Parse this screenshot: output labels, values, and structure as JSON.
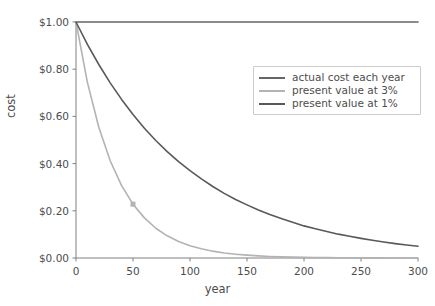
{
  "chart_data": {
    "type": "line",
    "title": "",
    "xlabel": "year",
    "ylabel": "cost",
    "xlim": [
      0,
      300
    ],
    "ylim": [
      0.0,
      1.0
    ],
    "grid": false,
    "legend_position": "upper right",
    "x_ticks": [
      0,
      50,
      100,
      150,
      200,
      250,
      300
    ],
    "x_tick_labels": [
      "0",
      "50",
      "100",
      "150",
      "200",
      "250",
      "300"
    ],
    "y_ticks": [
      0.0,
      0.2,
      0.4,
      0.6,
      0.8,
      1.0
    ],
    "y_tick_labels": [
      "$0.00",
      "$0.20",
      "$0.40",
      "$0.60",
      "$0.80",
      "$1.00"
    ],
    "x": [
      0,
      10,
      20,
      30,
      40,
      50,
      60,
      70,
      80,
      90,
      100,
      110,
      120,
      130,
      140,
      150,
      160,
      170,
      180,
      190,
      200,
      210,
      220,
      230,
      240,
      250,
      260,
      270,
      280,
      290,
      300
    ],
    "series": [
      {
        "name": "actual cost each year",
        "color": "#666666",
        "linewidth": 1.6,
        "values": [
          1.0,
          1.0,
          1.0,
          1.0,
          1.0,
          1.0,
          1.0,
          1.0,
          1.0,
          1.0,
          1.0,
          1.0,
          1.0,
          1.0,
          1.0,
          1.0,
          1.0,
          1.0,
          1.0,
          1.0,
          1.0,
          1.0,
          1.0,
          1.0,
          1.0,
          1.0,
          1.0,
          1.0,
          1.0,
          1.0,
          1.0
        ]
      },
      {
        "name": "present value at 3%",
        "color": "#b3b3b3",
        "linewidth": 1.6,
        "values": [
          1.0,
          0.744,
          0.554,
          0.412,
          0.307,
          0.228,
          0.17,
          0.126,
          0.094,
          0.07,
          0.052,
          0.039,
          0.029,
          0.021,
          0.016,
          0.012,
          0.009,
          0.0066,
          0.0049,
          0.0036,
          0.0027,
          0.002,
          0.0015,
          0.0011,
          0.0008,
          0.0006,
          0.00045,
          0.00033,
          0.00025,
          0.00018,
          0.00014
        ]
      },
      {
        "name": "present value at 1%",
        "color": "#595959",
        "linewidth": 1.6,
        "values": [
          1.0,
          0.905,
          0.82,
          0.742,
          0.672,
          0.608,
          0.55,
          0.498,
          0.451,
          0.408,
          0.37,
          0.335,
          0.303,
          0.274,
          0.248,
          0.225,
          0.203,
          0.184,
          0.167,
          0.151,
          0.136,
          0.124,
          0.112,
          0.101,
          0.092,
          0.083,
          0.075,
          0.068,
          0.061,
          0.055,
          0.05
        ]
      }
    ],
    "markers": [
      {
        "series": "present value at 3%",
        "x": 50,
        "y": 0.228,
        "shape": "square",
        "color": "#b3b3b3",
        "size": 5
      }
    ],
    "axis_color": "#808080",
    "tick_color": "#808080",
    "background": "#ffffff"
  },
  "legend": {
    "items": [
      {
        "label": "actual cost each year"
      },
      {
        "label": "present value at 3%"
      },
      {
        "label": "present value at 1%"
      }
    ]
  }
}
